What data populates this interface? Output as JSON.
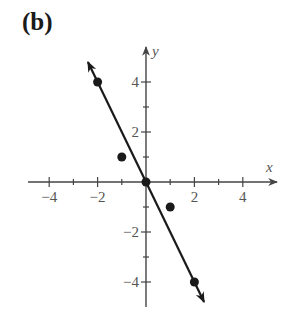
{
  "panel": {
    "label": "(b)"
  },
  "chart_data": {
    "type": "scatter",
    "title": "(b)",
    "xlabel": "x",
    "ylabel": "y",
    "xlim": [
      -5,
      5
    ],
    "ylim": [
      -5,
      5
    ],
    "grid": false,
    "x_ticks": [
      -4,
      -3,
      -2,
      -1,
      1,
      2,
      3,
      4
    ],
    "x_tick_labels": [
      "-4",
      "-2",
      "2",
      "4"
    ],
    "x_tick_label_values": [
      -4,
      -2,
      2,
      4
    ],
    "y_ticks": [
      -4,
      -3,
      -2,
      -1,
      1,
      2,
      3,
      4
    ],
    "y_tick_labels": [
      "4",
      "2",
      "-2",
      "-4"
    ],
    "y_tick_label_values": [
      4,
      2,
      -2,
      -4
    ],
    "series": [
      {
        "name": "points",
        "type": "scatter",
        "x": [
          -2,
          -1,
          0,
          1,
          2
        ],
        "y": [
          4,
          1,
          0,
          -1,
          -4
        ]
      },
      {
        "name": "line",
        "type": "line",
        "equation": "y = -2x",
        "x": [
          -2.4,
          2.4
        ],
        "y": [
          4.8,
          -4.8
        ],
        "arrows": "both"
      }
    ]
  },
  "colors": {
    "ink": "#1a1a1a",
    "axis": "#444444",
    "text": "#555555"
  }
}
